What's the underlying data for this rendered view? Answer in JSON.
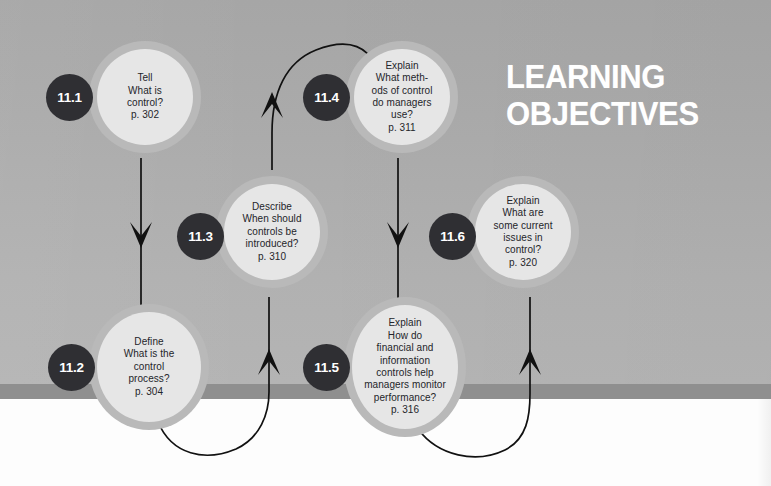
{
  "heading": {
    "line1": "LEARNING",
    "line2": "OBJECTIVES",
    "color": "#ffffff"
  },
  "theme": {
    "background_top": "#a6a6a6",
    "background_bottom": "#b4b4b4",
    "band": "#8f8f8f",
    "page_white": "#fdfdfd",
    "node_ring": "#b9b9b9",
    "node_fill": "#e6e6e6",
    "badge_fill": "#2f2f33",
    "badge_text": "#ffffff",
    "node_text": "#24252a",
    "connector": "#111111"
  },
  "nodes": [
    {
      "id": "11.1",
      "badge": "11.1",
      "verb": "Tell",
      "question": "What is\ncontrol?",
      "page": "p. 302",
      "text": "Tell\nWhat is\ncontrol?\np. 302"
    },
    {
      "id": "11.2",
      "badge": "11.2",
      "verb": "Define",
      "question": "What is the\ncontrol\nprocess?",
      "page": "p. 304",
      "text": "Define\nWhat is the\ncontrol\nprocess?\np. 304"
    },
    {
      "id": "11.3",
      "badge": "11.3",
      "verb": "Describe",
      "question": "When should\ncontrols be\nintroduced?",
      "page": "p. 310",
      "text": "Describe\nWhen should\ncontrols be\nintroduced?\np. 310"
    },
    {
      "id": "11.4",
      "badge": "11.4",
      "verb": "Explain",
      "question": "What meth-\nods of control\ndo managers\nuse?",
      "page": "p. 311",
      "text": "Explain\nWhat meth-\nods of control\ndo managers\nuse?\np. 311"
    },
    {
      "id": "11.5",
      "badge": "11.5",
      "verb": "Explain",
      "question": "How do\nfinancial and\ninformation\ncontrols help\nmanagers monitor\nperformance?",
      "page": "p. 316",
      "text": "Explain\nHow do\nfinancial and\ninformation\ncontrols help\nmanagers monitor\nperformance?\np. 316"
    },
    {
      "id": "11.6",
      "badge": "11.6",
      "verb": "Explain",
      "question": "What are\nsome current\nissues in\ncontrol?",
      "page": "p. 320",
      "text": "Explain\nWhat are\nsome current\nissues in\ncontrol?\np. 320"
    }
  ],
  "connectors": [
    {
      "from": "11.1",
      "to": "11.2",
      "style": "straight-down"
    },
    {
      "from": "11.2",
      "to": "11.3",
      "style": "curve-up-right"
    },
    {
      "from": "11.3",
      "to": "11.4",
      "style": "curve-up-over"
    },
    {
      "from": "11.4",
      "to": "11.5",
      "style": "straight-down"
    },
    {
      "from": "11.5",
      "to": "11.6",
      "style": "curve-up-right"
    }
  ]
}
